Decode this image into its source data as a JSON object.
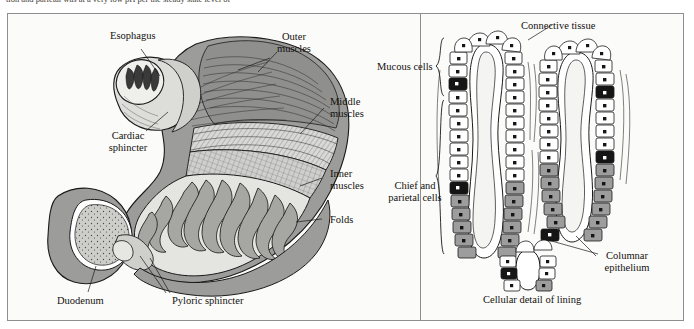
{
  "page": {
    "running_text": "tion and parietal was at a very low pH per the steady state level of",
    "background_color": "#fbfbfa",
    "border_color": "#8e8e8e",
    "ink_color": "#13110d"
  },
  "figure": {
    "left_panel": {
      "name": "stomach-anatomy",
      "labels": [
        {
          "id": "esophagus",
          "text": "Esophagus",
          "x": 110,
          "y": 36,
          "align": "left"
        },
        {
          "id": "outer-muscles",
          "text": "Outer\nmuscles",
          "x": 272,
          "y": 36,
          "align": "left"
        },
        {
          "id": "middle-muscles",
          "text": "Middle\nmuscles",
          "x": 328,
          "y": 98,
          "align": "left"
        },
        {
          "id": "cardiac-sphincter",
          "text": "Cardiac\nsphincter",
          "x": 100,
          "y": 133,
          "align": "left"
        },
        {
          "id": "inner-muscles",
          "text": "Inner\nmuscles",
          "x": 326,
          "y": 170,
          "align": "left"
        },
        {
          "id": "folds",
          "text": "Folds",
          "x": 326,
          "y": 216,
          "align": "left"
        },
        {
          "id": "duodenum",
          "text": "Duodenum",
          "x": 57,
          "y": 297,
          "align": "left"
        },
        {
          "id": "pyloric-sphincter",
          "text": "Pyloric sphincter",
          "x": 168,
          "y": 297,
          "align": "left"
        }
      ]
    },
    "right_panel": {
      "name": "cellular-detail",
      "caption": "Cellular detail of lining",
      "labels": [
        {
          "id": "connective-tissue",
          "text": "Connective tissue",
          "x": 521,
          "y": 21,
          "align": "left"
        },
        {
          "id": "mucous-cells",
          "text": "Mucous cells",
          "x": 377,
          "y": 62,
          "align": "left"
        },
        {
          "id": "chief-parietal-cells",
          "text": "Chief and\nparietal cells",
          "x": 383,
          "y": 183,
          "align": "left"
        },
        {
          "id": "columnar-epithelium",
          "text": "Columnar\nepithelium",
          "x": 598,
          "y": 252,
          "align": "left"
        }
      ],
      "braces": [
        {
          "id": "mucous-cells-brace",
          "x": 451,
          "y_top": 38,
          "y_bottom": 96
        },
        {
          "id": "chief-cells-brace",
          "x": 451,
          "y_top": 100,
          "y_bottom": 254
        }
      ]
    },
    "colors": {
      "outline": "#1a1a1a",
      "tissue_gray": "#9a9a9a",
      "tissue_light": "#c9c9c7",
      "cell_gray": "#9d9d9d",
      "nucleus_dark": "#151515",
      "lumen_white": "#ffffff"
    }
  }
}
